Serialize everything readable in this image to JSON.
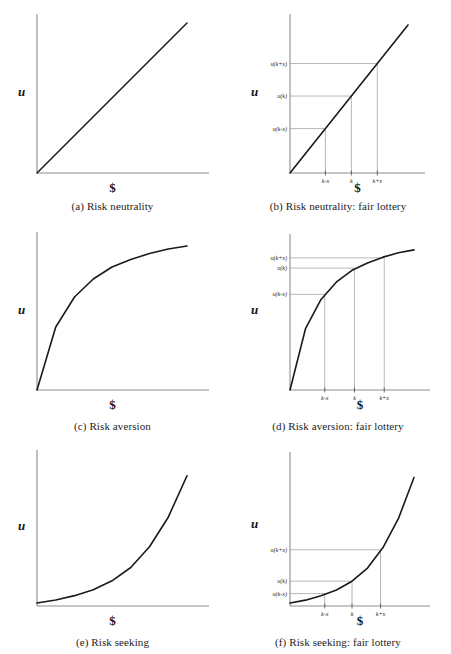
{
  "figure": {
    "axis_y_label": "u",
    "axis_x_label": "$"
  },
  "chart_data": [
    {
      "type": "line",
      "panel": "a",
      "title": "(a) Risk neutrality",
      "xlabel": "$",
      "ylabel": "u",
      "curve": "linear",
      "description": "Straight line utility of money through the origin, constant marginal utility",
      "x": [
        0,
        0.125,
        0.25,
        0.375,
        0.5,
        0.625,
        0.75,
        0.875,
        1.0
      ],
      "values": [
        0,
        0.125,
        0.25,
        0.375,
        0.5,
        0.625,
        0.75,
        0.875,
        1.0
      ],
      "xlim": [
        0,
        1
      ],
      "ylim": [
        0,
        1
      ],
      "grid": false,
      "ticks": [],
      "guides": []
    },
    {
      "type": "line",
      "panel": "b",
      "title": "(b) Risk neutrality: fair lottery",
      "xlabel": "$",
      "ylabel": "u",
      "curve": "linear",
      "description": "Linear utility with fair lottery outcomes k-x, k, k+x; utility of expected value equals expected utility",
      "x": [
        0,
        0.125,
        0.25,
        0.375,
        0.5,
        0.625,
        0.75,
        0.875,
        1.0
      ],
      "values": [
        0,
        0.125,
        0.25,
        0.375,
        0.5,
        0.625,
        0.75,
        0.875,
        1.0
      ],
      "xlim": [
        0,
        1
      ],
      "ylim": [
        0,
        1
      ],
      "grid": false,
      "ticks": [
        {
          "label": "k-x",
          "x": 0.3
        },
        {
          "label": "k",
          "x": 0.52
        },
        {
          "label": "k+x",
          "x": 0.74
        }
      ],
      "guides": [
        {
          "label": "u(k-x)",
          "x": 0.3,
          "y": 0.3
        },
        {
          "label": "u(k)",
          "x": 0.52,
          "y": 0.52
        },
        {
          "label": "u(k+x)",
          "x": 0.74,
          "y": 0.74
        }
      ]
    },
    {
      "type": "line",
      "panel": "c",
      "title": "(c) Risk aversion",
      "xlabel": "$",
      "ylabel": "u",
      "curve": "concave",
      "description": "Concave utility of money, diminishing marginal utility",
      "x": [
        0,
        0.125,
        0.25,
        0.375,
        0.5,
        0.625,
        0.75,
        0.875,
        1.0
      ],
      "values": [
        0.0,
        0.42,
        0.62,
        0.74,
        0.82,
        0.87,
        0.91,
        0.94,
        0.96
      ],
      "xlim": [
        0,
        1
      ],
      "ylim": [
        0,
        1
      ],
      "grid": false,
      "ticks": [],
      "guides": []
    },
    {
      "type": "line",
      "panel": "d",
      "title": "(d) Risk aversion: fair lottery",
      "xlabel": "$",
      "ylabel": "u",
      "curve": "concave",
      "description": "Concave utility with fair lottery outcomes k-x, k, k+x; u(k) exceeds expected utility of the lottery",
      "x": [
        0,
        0.125,
        0.25,
        0.375,
        0.5,
        0.625,
        0.75,
        0.875,
        1.0
      ],
      "values": [
        0.0,
        0.42,
        0.62,
        0.74,
        0.82,
        0.87,
        0.91,
        0.94,
        0.96
      ],
      "xlim": [
        0,
        1
      ],
      "ylim": [
        0,
        1
      ],
      "grid": false,
      "ticks": [
        {
          "label": "k-x",
          "x": 0.28
        },
        {
          "label": "k",
          "x": 0.52
        },
        {
          "label": "k+x",
          "x": 0.76
        }
      ],
      "guides": [
        {
          "label": "u(k-x)",
          "x": 0.28,
          "y": 0.655
        },
        {
          "label": "u(k)",
          "x": 0.52,
          "y": 0.835
        },
        {
          "label": "u(k+x)",
          "x": 0.76,
          "y": 0.905
        }
      ]
    },
    {
      "type": "line",
      "panel": "e",
      "title": "(e) Risk seeking",
      "xlabel": "$",
      "ylabel": "u",
      "curve": "convex",
      "description": "Convex utility of money, increasing marginal utility",
      "x": [
        0,
        0.125,
        0.25,
        0.375,
        0.5,
        0.625,
        0.75,
        0.875,
        1.0
      ],
      "values": [
        0.02,
        0.04,
        0.07,
        0.11,
        0.17,
        0.26,
        0.4,
        0.6,
        0.88
      ],
      "xlim": [
        0,
        1
      ],
      "ylim": [
        0,
        1
      ],
      "grid": false,
      "ticks": [],
      "guides": []
    },
    {
      "type": "line",
      "panel": "f",
      "title": "(f) Risk seeking: fair lottery",
      "xlabel": "$",
      "ylabel": "u",
      "curve": "convex",
      "description": "Convex utility with fair lottery outcomes k-x, k, k+x; expected utility of the lottery exceeds u(k)",
      "x": [
        0,
        0.125,
        0.25,
        0.375,
        0.5,
        0.625,
        0.75,
        0.875,
        1.0
      ],
      "values": [
        0.02,
        0.04,
        0.07,
        0.11,
        0.17,
        0.26,
        0.4,
        0.6,
        0.88
      ],
      "xlim": [
        0,
        1
      ],
      "ylim": [
        0,
        1
      ],
      "grid": false,
      "ticks": [
        {
          "label": "k-x",
          "x": 0.28
        },
        {
          "label": "k",
          "x": 0.5
        },
        {
          "label": "k+x",
          "x": 0.73
        }
      ],
      "guides": [
        {
          "label": "u(k-x)",
          "x": 0.28,
          "y": 0.085
        },
        {
          "label": "u(k)",
          "x": 0.5,
          "y": 0.17
        },
        {
          "label": "u(k+x)",
          "x": 0.73,
          "y": 0.385
        }
      ]
    }
  ]
}
